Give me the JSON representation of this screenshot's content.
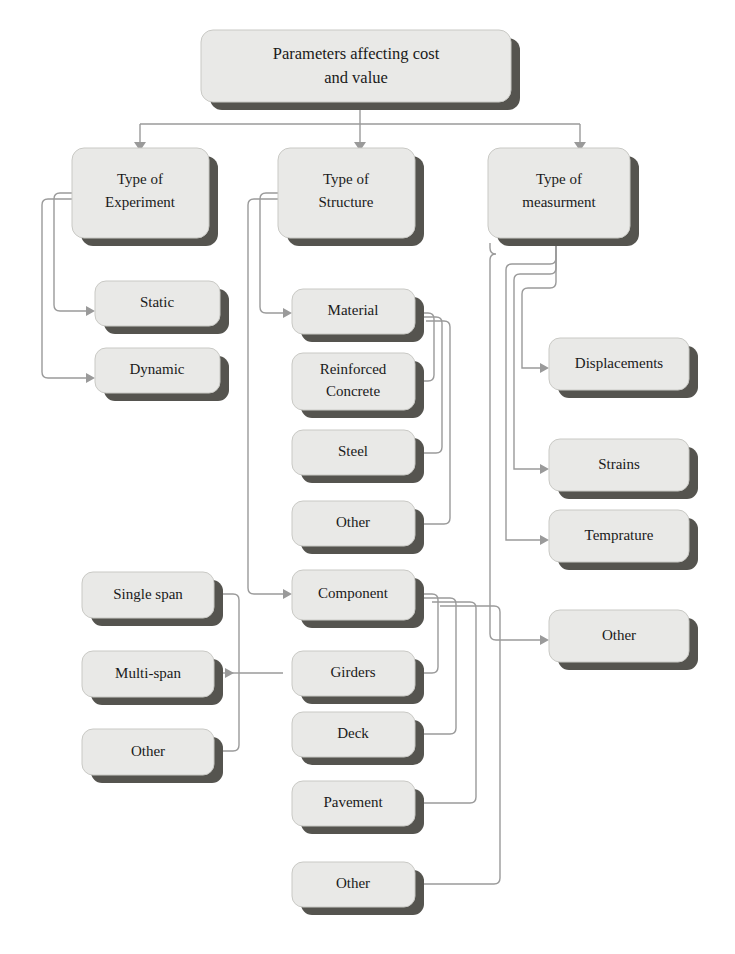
{
  "diagram": {
    "title": "Parameters affecting cost and value",
    "background_color": "#ffffff",
    "box_fill_color": "#e9e9e7",
    "box_shadow_color": "#55544f",
    "connector_color": "#9a9a9a",
    "text_color": "#1a1a1a",
    "root": {
      "id": "root",
      "label_line1": "Parameters affecting cost",
      "label_line2": "and value"
    },
    "branches": [
      {
        "id": "type-of-experiment",
        "label_line1": "Type of",
        "label_line2": "Experiment",
        "children": [
          {
            "id": "static",
            "label": "Static"
          },
          {
            "id": "dynamic",
            "label": "Dynamic"
          }
        ]
      },
      {
        "id": "type-of-structure",
        "label_line1": "Type of",
        "label_line2": "Structure",
        "children": [
          {
            "id": "material",
            "label": "Material",
            "children": [
              {
                "id": "reinforced-concrete",
                "label_line1": "Reinforced",
                "label_line2": "Concrete"
              },
              {
                "id": "steel",
                "label": "Steel"
              },
              {
                "id": "material-other",
                "label": "Other"
              }
            ]
          },
          {
            "id": "component",
            "label": "Component",
            "children": [
              {
                "id": "girders",
                "label": "Girders"
              },
              {
                "id": "deck",
                "label": "Deck"
              },
              {
                "id": "pavement",
                "label": "Pavement"
              },
              {
                "id": "component-other",
                "label": "Other"
              }
            ]
          }
        ]
      },
      {
        "id": "type-of-measurment",
        "label_line1": "Type of",
        "label_line2": "measurment",
        "children": [
          {
            "id": "displacements",
            "label": "Displacements"
          },
          {
            "id": "strains",
            "label": "Strains"
          },
          {
            "id": "temprature",
            "label": "Temprature"
          },
          {
            "id": "measurment-other",
            "label": "Other"
          }
        ]
      }
    ],
    "span_group": {
      "id": "span-group",
      "items": [
        {
          "id": "single-span",
          "label": "Single span"
        },
        {
          "id": "multi-span",
          "label": "Multi-span"
        },
        {
          "id": "span-other",
          "label": "Other"
        }
      ]
    }
  }
}
